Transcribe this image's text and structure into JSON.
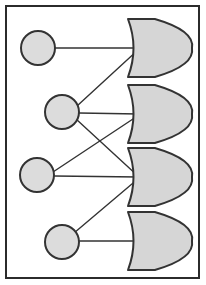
{
  "canvas": {
    "width": 206,
    "height": 285,
    "background": "#ffffff",
    "title": "Logic gate network diagram"
  },
  "frame": {
    "name": "outer-border",
    "x": 6,
    "y": 6,
    "width": 193,
    "height": 272,
    "stroke": "#2b2b2b",
    "stroke_width": 2,
    "fill": "#ffffff"
  },
  "style": {
    "node_fill": "#dcdcdc",
    "node_stroke": "#333333",
    "node_stroke_width": 2,
    "gate_fill": "#d6d6d6",
    "gate_stroke": "#333333",
    "gate_stroke_width": 2,
    "edge_stroke": "#333333",
    "edge_stroke_width": 1.4
  },
  "nodes": [
    {
      "id": "n1",
      "label": "",
      "cx": 38,
      "cy": 48,
      "r": 17
    },
    {
      "id": "n2",
      "label": "",
      "cx": 62,
      "cy": 112,
      "r": 17
    },
    {
      "id": "n3",
      "label": "",
      "cx": 37,
      "cy": 175,
      "r": 17
    },
    {
      "id": "n4",
      "label": "",
      "cx": 62,
      "cy": 242,
      "r": 17
    }
  ],
  "gates": [
    {
      "id": "g1",
      "label": "",
      "type": "or-gate",
      "x": 128,
      "y": 19,
      "width": 64,
      "height": 58,
      "input_x": 139,
      "input_y": 48
    },
    {
      "id": "g2",
      "label": "",
      "type": "or-gate",
      "x": 128,
      "y": 85,
      "width": 64,
      "height": 58,
      "input_x": 139,
      "input_y": 114
    },
    {
      "id": "g3",
      "label": "",
      "type": "or-gate",
      "x": 128,
      "y": 148,
      "width": 64,
      "height": 58,
      "input_x": 139,
      "input_y": 177
    },
    {
      "id": "g4",
      "label": "",
      "type": "or-gate",
      "x": 128,
      "y": 212,
      "width": 64,
      "height": 58,
      "input_x": 139,
      "input_y": 241
    }
  ],
  "edges": [
    {
      "id": "e1",
      "from": "n1",
      "to": "g1",
      "x1": 55,
      "y1": 48,
      "x2": 139,
      "y2": 48
    },
    {
      "id": "e2",
      "from": "n2",
      "to": "g1",
      "x1": 77,
      "y1": 106,
      "x2": 139,
      "y2": 49
    },
    {
      "id": "e3",
      "from": "n2",
      "to": "g2",
      "x1": 79,
      "y1": 113,
      "x2": 139,
      "y2": 114
    },
    {
      "id": "e4",
      "from": "n2",
      "to": "g3",
      "x1": 76,
      "y1": 119,
      "x2": 139,
      "y2": 177
    },
    {
      "id": "e5",
      "from": "n3",
      "to": "g2",
      "x1": 53,
      "y1": 172,
      "x2": 139,
      "y2": 115
    },
    {
      "id": "e6",
      "from": "n3",
      "to": "g3",
      "x1": 54,
      "y1": 176,
      "x2": 139,
      "y2": 177
    },
    {
      "id": "e7",
      "from": "n4",
      "to": "g3",
      "x1": 74,
      "y1": 233,
      "x2": 139,
      "y2": 178
    },
    {
      "id": "e8",
      "from": "n4",
      "to": "g4",
      "x1": 79,
      "y1": 241,
      "x2": 139,
      "y2": 241
    }
  ],
  "diagram_meta": {
    "node_count": 4,
    "gate_count": 4,
    "edge_count": 8
  }
}
